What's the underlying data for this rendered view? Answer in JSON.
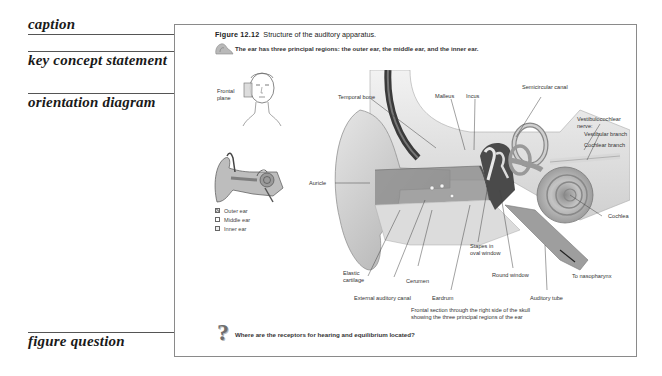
{
  "annotations": [
    {
      "id": "caption",
      "label": "caption"
    },
    {
      "id": "key-concept",
      "label": "key concept statement"
    },
    {
      "id": "orientation",
      "label": "orientation diagram"
    },
    {
      "id": "figure-question",
      "label": "figure question"
    }
  ],
  "figure": {
    "number": "Figure 12.12",
    "title": "Structure of the auditory apparatus.",
    "key_concept": "The ear has three principal regions: the outer ear, the middle ear, and the inner ear.",
    "orientation": {
      "plane_label": "Frontal plane",
      "legend": [
        {
          "label": "Outer ear",
          "pattern": "shaded"
        },
        {
          "label": "Middle ear",
          "pattern": "blank"
        },
        {
          "label": "Inner ear",
          "pattern": "dotted"
        }
      ]
    },
    "labels": {
      "temporal_bone": "Temporal bone",
      "malleus": "Malleus",
      "incus": "Incus",
      "semicircular_canal": "Semicircular canal",
      "vestibulocochlear_nerve": "Vestibulocochlear nerve:",
      "vestibular_branch": "Vestibular branch",
      "cochlear_branch": "Cochlear branch",
      "auricle": "Auricle",
      "cochlea": "Cochlea",
      "stapes_line1": "Stapes in",
      "stapes_line2": "oval window",
      "elastic_line1": "Elastic",
      "elastic_line2": "cartilage",
      "cerumen": "Cerumen",
      "round_window": "Round window",
      "to_nasopharynx": "To nasopharynx",
      "external_auditory_canal": "External auditory canal",
      "eardrum": "Eardrum",
      "auditory_tube": "Auditory tube"
    },
    "section_caption_line1": "Frontal section through the right side of the skull",
    "section_caption_line2": "showing the three principal regions of the ear",
    "question": "Where are the receptors for hearing and equilibrium located?"
  },
  "icons": {
    "ear_thumbnail": "ear-icon",
    "question_mark": "question-mark-icon"
  }
}
